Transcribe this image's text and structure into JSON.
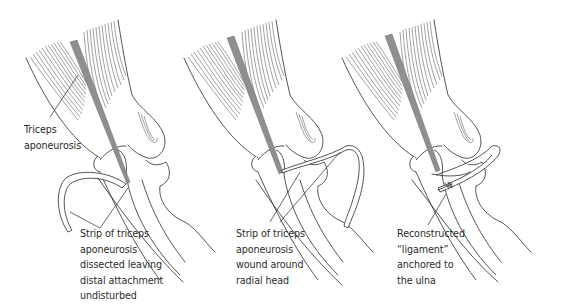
{
  "figure": {
    "panels": [
      {
        "id": "panel-1",
        "labels": [
          {
            "name": "triceps-aponeurosis-label",
            "lines": [
              "Triceps",
              "aponeurosis"
            ]
          },
          {
            "name": "strip-dissected-label",
            "lines": [
              "Strip of triceps",
              "aponeurosis",
              "dissected leaving",
              "distal attachment",
              "undisturbed"
            ]
          }
        ]
      },
      {
        "id": "panel-2",
        "labels": [
          {
            "name": "strip-wound-label",
            "lines": [
              "Strip of triceps",
              "aponeurosis",
              "wound around",
              "radial head"
            ]
          }
        ]
      },
      {
        "id": "panel-3",
        "labels": [
          {
            "name": "reconstructed-ligament-label",
            "lines": [
              "Reconstructed",
              "“ligament”",
              "anchored to",
              "the ulna"
            ]
          }
        ]
      }
    ],
    "colors": {
      "line": "#2a2a2a",
      "tendon": "#8f8f8f",
      "background": "#ffffff"
    }
  }
}
